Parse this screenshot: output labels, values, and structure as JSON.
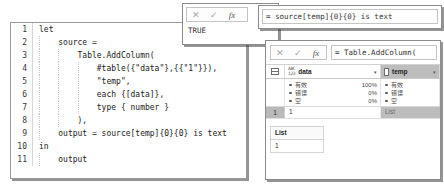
{
  "code_editor": {
    "lines": [
      {
        "n": "1",
        "text": "let"
      },
      {
        "n": "2",
        "text": "    source ="
      },
      {
        "n": "3",
        "text": "        Table.AddColumn("
      },
      {
        "n": "4",
        "text": "            #table({\"data\"},{{\"1\"}}),"
      },
      {
        "n": "5",
        "text": "            \"temp\","
      },
      {
        "n": "6",
        "text": "            each {[data]},"
      },
      {
        "n": "7",
        "text": "            type { number }"
      },
      {
        "n": "8",
        "text": "        ),"
      },
      {
        "n": "9",
        "text": "    output = source[temp]{0}{0} is text"
      },
      {
        "n": "10",
        "text": "in"
      },
      {
        "n": "11",
        "text": "    output"
      }
    ]
  },
  "preview_panel_a": {
    "cancel_icon": "✕",
    "confirm_icon": "✓",
    "fx_icon": "fx",
    "result_value": "TRUE"
  },
  "formula_panel_b": {
    "formula": "= source[temp]{0}{0} is text"
  },
  "query_panel_c": {
    "cancel_icon": "✕",
    "confirm_icon": "✓",
    "fx_icon": "fx",
    "formula": "= Table.AddColumn(",
    "columns": [
      {
        "name": "data",
        "type_icon_top": "ABC",
        "type_icon_bottom": "123",
        "caret": "▾"
      },
      {
        "name": "temp",
        "caret": "▾"
      }
    ],
    "quality": {
      "data": [
        {
          "label": "有效",
          "pct": "100%"
        },
        {
          "label": "错误",
          "pct": "0%"
        },
        {
          "label": "空",
          "pct": "0%"
        }
      ],
      "temp": [
        {
          "label": "有效"
        },
        {
          "label": "错误"
        },
        {
          "label": "空"
        }
      ]
    },
    "rows": [
      {
        "num": "1",
        "data": "1",
        "temp": "List"
      }
    ],
    "list_preview": {
      "header": "List",
      "values": [
        "1"
      ]
    }
  },
  "colors": {
    "selection_gray": "#bdbdbd",
    "panel_border": "#8b8b8b",
    "text": "#1a1a1a",
    "muted": "#8e8e8e"
  }
}
